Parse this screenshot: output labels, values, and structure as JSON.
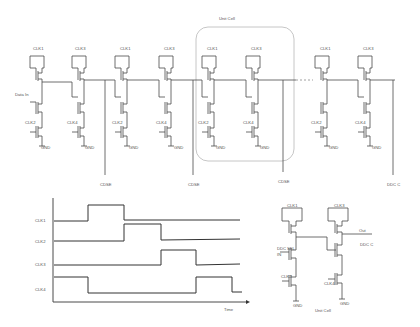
{
  "top_schematic": {
    "unit_cell_label": "Unit Cell",
    "data_in_label": "Data In",
    "stages": [
      {
        "top_clk": "CLK1",
        "bot_clk": "CLK2",
        "gnd": "GND"
      },
      {
        "top_clk": "CLK3",
        "bot_clk": "CLK4",
        "gnd": "GND"
      },
      {
        "top_clk": "CLK1",
        "bot_clk": "CLK2",
        "gnd": "GND"
      },
      {
        "top_clk": "CLK3",
        "bot_clk": "CLK4",
        "gnd": "GND"
      },
      {
        "top_clk": "CLK1",
        "bot_clk": "CLK2",
        "gnd": "GND"
      },
      {
        "top_clk": "CLK3",
        "bot_clk": "CLK4",
        "gnd": "GND"
      },
      {
        "top_clk": "CLK1",
        "bot_clk": "CLK2",
        "gnd": "GND"
      },
      {
        "top_clk": "CLK3",
        "bot_clk": "CLK4",
        "gnd": "GND"
      }
    ],
    "output_labels": [
      "CDSE",
      "CDSE",
      "CDSE",
      "DDC C"
    ]
  },
  "timing_diagram": {
    "signals": [
      "CLK1",
      "CLK2",
      "CLK3",
      "CLK4"
    ],
    "x_axis_label": "Time"
  },
  "unit_cell_detail": {
    "top_clk_left": "CLK1",
    "top_clk_right": "CLK3",
    "bot_clk_left": "CLK2",
    "bot_clk_right": "CLK4",
    "input_label_top": "DDC",
    "input_label_sel": "SEL",
    "input_label_in": "IN",
    "out_label": "Out",
    "out_sub_label": "DDC C",
    "gnd_left": "GND",
    "gnd_right": "GND",
    "caption": "Unit Cell"
  }
}
